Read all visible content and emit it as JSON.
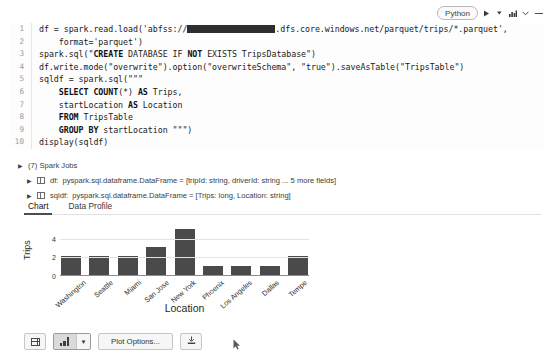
{
  "cell_toolbar": {
    "language_label": "Python",
    "run_icon": "play-icon",
    "run_caret_icon": "caret-down-icon",
    "chart_icon": "bar-chart-icon",
    "collapse_icon": "chevron-down-icon",
    "minimize_icon": "minus-icon"
  },
  "code": {
    "lines": [
      {
        "n": "1",
        "text": "df = spark.read.load('abfss://"
      },
      {
        "n": "2",
        "text": "    format='parquet')"
      },
      {
        "n": "3",
        "text": "spark.sql(\"CREATE DATABASE IF NOT EXISTS TripsDatabase\")"
      },
      {
        "n": "4",
        "text": "df.write.mode(\"overwrite\").option(\"overwriteSchema\", \"true\").saveAsTable(\"TripsTable\")"
      },
      {
        "n": "5",
        "text": "sqldf = spark.sql(\"\"\""
      },
      {
        "n": "6",
        "text": "    SELECT COUNT(*) AS Trips,"
      },
      {
        "n": "7",
        "text": "    startLocation AS Location"
      },
      {
        "n": "8",
        "text": "    FROM TripsTable"
      },
      {
        "n": "9",
        "text": "    GROUP BY startLocation \"\"\")"
      },
      {
        "n": "10",
        "text": "display(sqldf)"
      }
    ],
    "line1_prefix": "df = spark.read.load('abfss://",
    "line1_suffix": ".dfs.core.windows.net/parquet/trips/*.parquet',",
    "redacted_label": "redacted-storage-account"
  },
  "results_meta": {
    "spark_jobs": "(7) Spark Jobs",
    "dataframes": [
      {
        "name": "df:",
        "desc": "pyspark.sql.dataframe.DataFrame = [tripId: string, driverId: string ... 5 more fields]"
      },
      {
        "name": "sqldf:",
        "desc": "pyspark.sql.dataframe.DataFrame = [Trips: long, Location: string]"
      }
    ]
  },
  "tabs": [
    {
      "label": "Chart",
      "active": true
    },
    {
      "label": "Data Profile",
      "active": false
    }
  ],
  "chart_data": {
    "type": "bar",
    "title": "",
    "xlabel": "Location",
    "ylabel": "Trips",
    "categories": [
      "Washington",
      "Seattle",
      "Miami",
      "San Jose",
      "New York",
      "Phoenix",
      "Los Angeles",
      "Dallas",
      "Tempe"
    ],
    "values": [
      2,
      2,
      2,
      3,
      5,
      1,
      1,
      1,
      2
    ],
    "ylim": [
      0,
      5.4
    ],
    "yticks": [
      0,
      2,
      4
    ],
    "grid": true,
    "legend": "none",
    "bar_color": "#4a4a4a"
  },
  "bottom_toolbar": {
    "table_view_icon": "table-icon",
    "chart_view_icon": "bar-chart-icon",
    "chart_view_caret_icon": "caret-down-icon",
    "plot_options_label": "Plot Options...",
    "download_icon": "download-icon"
  }
}
